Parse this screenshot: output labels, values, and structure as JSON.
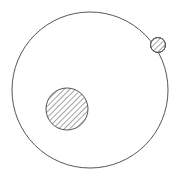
{
  "diagram": {
    "stroke_color": "#555555",
    "background": "#ffffff",
    "orbit": {
      "cx": 90,
      "cy": 90,
      "r": 78
    },
    "central_body": {
      "cx": 67,
      "cy": 109,
      "r": 21,
      "fill": "hatched"
    },
    "orbiting_body": {
      "cx": 158,
      "cy": 45,
      "r": 7.5,
      "fill": "hatched"
    }
  }
}
